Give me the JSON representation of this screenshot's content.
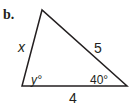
{
  "problem": {
    "label": "b.",
    "figure": "triangle",
    "sides": {
      "left": "x",
      "hypotenuse": "5",
      "bottom": "4"
    },
    "angles": {
      "bottom_left": "y°",
      "bottom_right": "40°"
    },
    "colors": {
      "stroke": "#231f20",
      "background": "#ffffff"
    }
  }
}
